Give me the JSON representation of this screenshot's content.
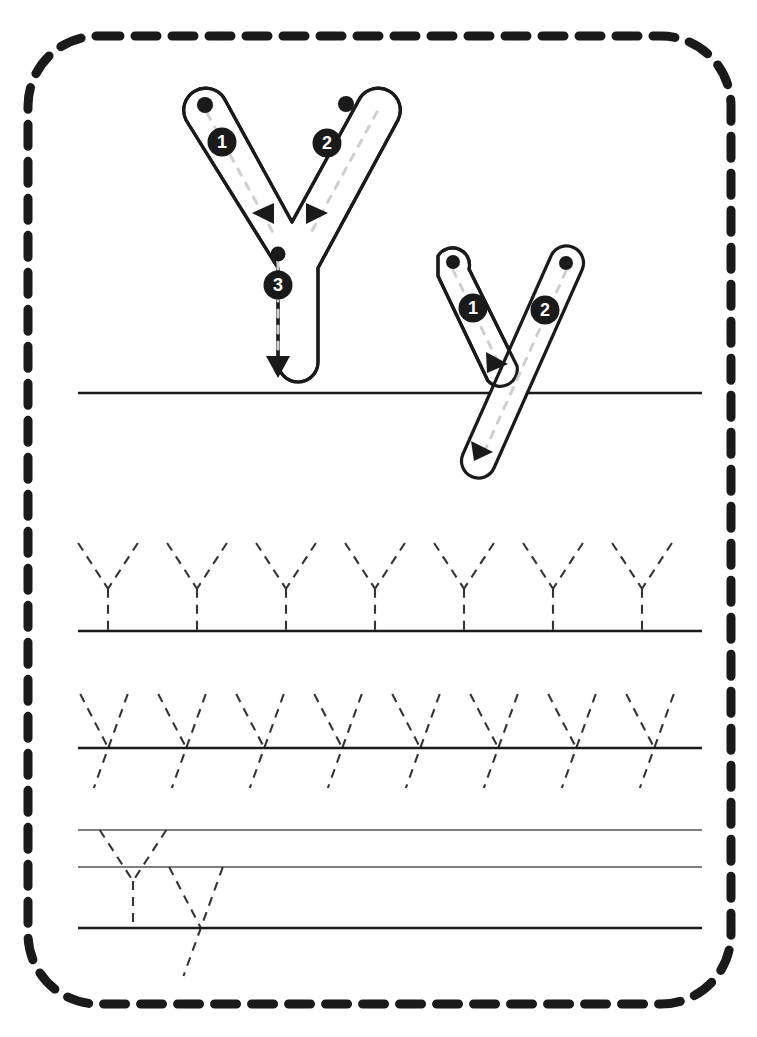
{
  "worksheet": {
    "title": "Letter Y Handwriting Tracing Worksheet",
    "letter_uppercase": "Y",
    "letter_lowercase": "y",
    "background_color": "#ffffff",
    "ink_color": "#1a1a1a",
    "guide_color": "#cccccc",
    "thin_line_color": "#555555"
  },
  "border": {
    "style": "dashed",
    "color": "#1a1a1a",
    "thickness": 9,
    "dash_length": 22,
    "dash_gap": 15,
    "corner_radius": 70,
    "x": 28,
    "y": 36,
    "width": 703,
    "height": 968
  },
  "model_uppercase": {
    "label": "Y",
    "stroke_count": 3,
    "strokes": [
      {
        "number": "1",
        "badge_x": 222,
        "badge_y": 142,
        "start_dot_x": 205,
        "start_dot_y": 105,
        "direction": "down-right",
        "arrow": "left-triangle"
      },
      {
        "number": "2",
        "badge_x": 327,
        "badge_y": 143,
        "start_dot_x": 346,
        "start_dot_y": 104,
        "direction": "down-left",
        "arrow": "right-triangle"
      },
      {
        "number": "3",
        "badge_x": 278,
        "badge_y": 285,
        "start_dot_x": 278,
        "start_dot_y": 254,
        "direction": "down",
        "arrow": "down-triangle"
      }
    ]
  },
  "model_lowercase": {
    "label": "y",
    "stroke_count": 2,
    "strokes": [
      {
        "number": "1",
        "badge_x": 473,
        "badge_y": 308,
        "start_dot_x": 453,
        "start_dot_y": 262,
        "direction": "down-right",
        "arrow": "down-right-triangle"
      },
      {
        "number": "2",
        "badge_x": 545,
        "badge_y": 310,
        "start_dot_x": 566,
        "start_dot_y": 263,
        "direction": "down-left-descender",
        "arrow": "down-right-triangle"
      }
    ]
  },
  "rows": [
    {
      "name": "model-row",
      "kind": "model",
      "baseline_y": 393,
      "line_left": 78,
      "line_right": 702,
      "line_color": "#1a1a1a",
      "line_width": 2.6,
      "letters": 0
    },
    {
      "name": "trace-row-uppercase",
      "kind": "trace",
      "letter": "Y",
      "letters": 7,
      "baseline_y": 631,
      "top_y": 543,
      "first_x": 108,
      "spacing": 89,
      "line_left": 78,
      "line_right": 702,
      "line_color": "#1a1a1a",
      "line_width": 2.6
    },
    {
      "name": "trace-row-lowercase",
      "kind": "trace",
      "letter": "y",
      "letters": 8,
      "baseline_y": 748,
      "top_y": 694,
      "descender_y": 788,
      "first_x": 104,
      "spacing": 78,
      "line_left": 78,
      "line_right": 702,
      "line_color": "#1a1a1a",
      "line_width": 2.6
    },
    {
      "name": "free-practice-row",
      "kind": "practice",
      "top_line_y": 830,
      "mid_line_y": 867,
      "baseline_y": 928,
      "line_left": 78,
      "line_right": 702,
      "thin_line_color": "#555555",
      "thin_line_width": 1.3,
      "baseline_color": "#1a1a1a",
      "baseline_width": 2.6,
      "sample_letters": [
        {
          "letter": "Y",
          "x": 133
        },
        {
          "letter": "y",
          "x": 196
        }
      ]
    }
  ],
  "dash_pattern": {
    "trace_dash": 9,
    "trace_gap": 7,
    "trace_width": 2.1,
    "trace_color": "#33333a"
  }
}
